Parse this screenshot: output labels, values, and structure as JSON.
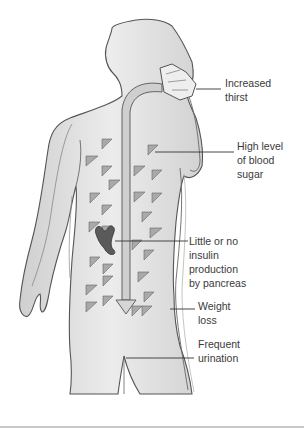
{
  "diagram": {
    "labels": [
      {
        "id": "thirst",
        "text": "Increased\nthirst"
      },
      {
        "id": "blood-sugar",
        "text": "High level\nof blood\nsugar"
      },
      {
        "id": "insulin",
        "text": "Little or no\ninsulin\nproduction\nby pancreas"
      },
      {
        "id": "weight",
        "text": "Weight\nloss"
      },
      {
        "id": "urination",
        "text": "Frequent\nurination"
      }
    ],
    "colors": {
      "body_fill": "#e4e4e4",
      "body_outline": "#555555",
      "triangle_fill": "#a9a9a9",
      "pancreas_fill": "#5a5a5a",
      "arrow_fill": "#cfcfcf",
      "leader_line": "#333333"
    }
  }
}
